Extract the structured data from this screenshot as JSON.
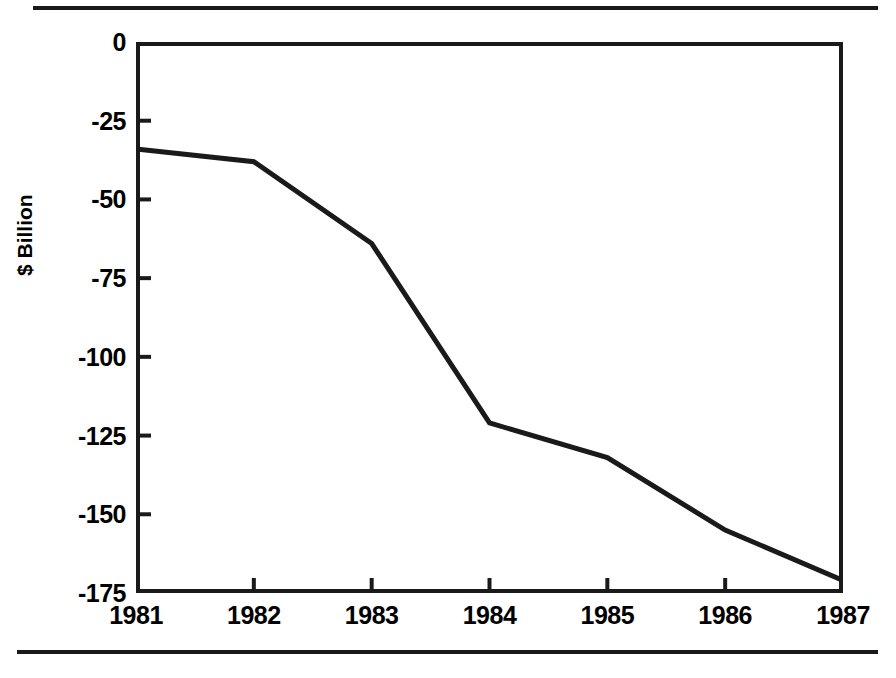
{
  "figure": {
    "background_color": "#ffffff",
    "ink_color": "#1a1a1a",
    "has_top_rule": true,
    "has_bottom_rule": true
  },
  "axis": {
    "y_title": "$ Billion",
    "y_ticks": [
      "0",
      "-25",
      "-50",
      "-75",
      "-100",
      "-125",
      "-150",
      "-175"
    ],
    "x_ticks": [
      "1981",
      "1982",
      "1983",
      "1984",
      "1985",
      "1986",
      "1987"
    ]
  },
  "chart_data": {
    "type": "line",
    "title": "",
    "subtitle": "",
    "xlabel": "",
    "ylabel": "$ Billion",
    "x": [
      1981,
      1982,
      1983,
      1984,
      1985,
      1986,
      1987
    ],
    "categories": [
      "1981",
      "1982",
      "1983",
      "1984",
      "1985",
      "1986",
      "1987"
    ],
    "values": [
      -34,
      -38,
      -64,
      -121,
      -132,
      -155,
      -171
    ],
    "series": [
      {
        "name": "$ Billion",
        "values": [
          -34,
          -38,
          -64,
          -121,
          -132,
          -155,
          -171
        ]
      }
    ],
    "ylim": [
      -175,
      0
    ],
    "xlim": [
      1981,
      1987
    ],
    "y_tick_values": [
      0,
      -25,
      -50,
      -75,
      -100,
      -125,
      -150,
      -175
    ],
    "x_tick_values": [
      1981,
      1982,
      1983,
      1984,
      1985,
      1986,
      1987
    ],
    "grid": false,
    "legend": false,
    "legend_position": "none",
    "line_color": "#1a1a1a",
    "line_width": 5,
    "markers": false,
    "annotations": []
  }
}
